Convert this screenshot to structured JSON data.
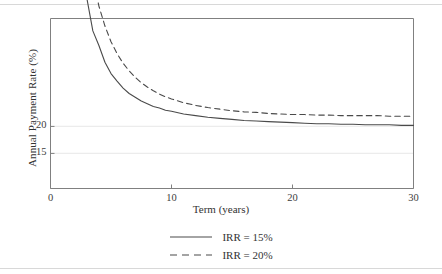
{
  "chart_data": {
    "type": "line",
    "title": "",
    "xlabel": "Term (years)",
    "ylabel": "Annual Payment Rate (%)",
    "xlim": [
      0,
      30
    ],
    "ylim": [
      8.5,
      40
    ],
    "xticks": [
      "0",
      "10",
      "20",
      "30"
    ],
    "xtick_values": [
      0,
      10,
      20,
      30
    ],
    "yticks": [
      "20",
      "15"
    ],
    "ytick_values": [
      20,
      15
    ],
    "grid": "horizontal-gridlines-at-yticks",
    "legend_position": "below-plot-center",
    "series": [
      {
        "name": "IRR = 15%",
        "style": "solid",
        "color": "#4a4a4a",
        "x": [
          2.2,
          2.5,
          3,
          3.5,
          4,
          4.5,
          5,
          5.5,
          6,
          6.5,
          7,
          7.5,
          8,
          8.5,
          9,
          9.5,
          10,
          11,
          12,
          13,
          14,
          15,
          16,
          17,
          18,
          19,
          20,
          21,
          22,
          23,
          24,
          25,
          26,
          27,
          28,
          29,
          30
        ],
        "values": [
          61.5,
          55.0,
          43.8,
          37.7,
          35.0,
          31.9,
          29.8,
          28.4,
          27.1,
          26.1,
          25.4,
          24.7,
          24.2,
          23.7,
          23.4,
          23.0,
          22.8,
          22.3,
          22.0,
          21.7,
          21.5,
          21.3,
          21.1,
          21.0,
          20.9,
          20.8,
          20.7,
          20.6,
          20.5,
          20.5,
          20.4,
          20.4,
          20.3,
          20.3,
          20.3,
          20.2,
          20.2
        ]
      },
      {
        "name": "IRR = 20%",
        "style": "dashed",
        "color": "#4a4a4a",
        "x": [
          2.6,
          3,
          3.5,
          4,
          4.5,
          5,
          5.5,
          6,
          6.5,
          7,
          7.5,
          8,
          8.5,
          9,
          9.5,
          10,
          11,
          12,
          13,
          14,
          15,
          16,
          17,
          18,
          19,
          20,
          21,
          22,
          23,
          24,
          25,
          26,
          27,
          28,
          29,
          30
        ],
        "values": [
          62.0,
          54.7,
          47.4,
          42.3,
          38.6,
          35.7,
          33.5,
          31.7,
          30.3,
          29.1,
          28.1,
          27.3,
          26.6,
          26.0,
          25.5,
          25.1,
          24.4,
          23.9,
          23.5,
          23.2,
          22.9,
          22.7,
          22.6,
          22.4,
          22.3,
          22.2,
          22.2,
          22.1,
          22.1,
          22.0,
          22.0,
          22.0,
          22.0,
          21.9,
          21.9,
          21.9
        ]
      }
    ],
    "series_asymptotes": {
      "IRR = 15%": 15.2,
      "IRR = 20%": 20.1
    },
    "colors": {
      "axis": "#808080",
      "gridline": "#ececec",
      "line": "#4a4a4a",
      "text": "#333333",
      "rule": "#d8d8d8",
      "background": "#ffffff"
    }
  },
  "legend": {
    "entries": [
      {
        "label": "IRR = 15%",
        "style": "solid"
      },
      {
        "label": "IRR = 20%",
        "style": "dashed"
      }
    ]
  },
  "axes": {
    "x_title": "Term (years)",
    "y_title": "Annual Payment Rate (%)",
    "x_tick_labels": [
      "0",
      "10",
      "20",
      "30"
    ],
    "y_tick_labels": [
      "20",
      "15"
    ]
  }
}
